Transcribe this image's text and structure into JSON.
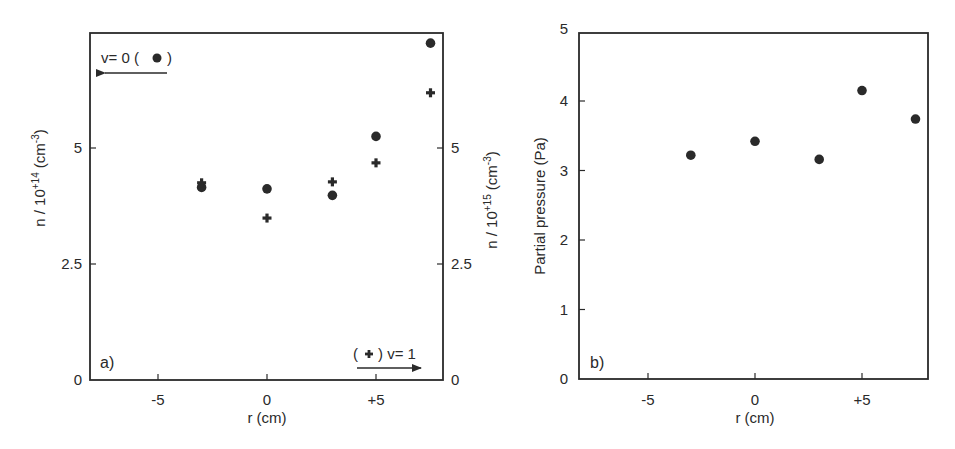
{
  "figure": {
    "panels": [
      {
        "id": "a",
        "panel_label": "a)",
        "xlabel": "r (cm)",
        "ylabel_left": {
          "prefix": "n / 10",
          "exp": "+14",
          "unit_pre": " (cm",
          "unit_exp": "-3",
          "unit_post": ")"
        },
        "ylabel_right": {
          "prefix": "n / 10",
          "exp": "+15",
          "unit_pre": " (cm",
          "unit_exp": "-3",
          "unit_post": ")"
        },
        "xticks": [
          "-5",
          "0",
          "+5"
        ],
        "yticks_left": [
          "0",
          "2.5",
          "5"
        ],
        "yticks_right": [
          "0",
          "2.5",
          "5"
        ],
        "legend": {
          "v0": {
            "label_pre": "v= 0 (",
            "marker": "●",
            "label_post": ")",
            "arrow": "left"
          },
          "v1": {
            "label_pre": "(",
            "marker": "✚",
            "label_post": ") v= 1",
            "arrow": "right"
          }
        }
      },
      {
        "id": "b",
        "panel_label": "b)",
        "xlabel": "r (cm)",
        "ylabel": "Partial pressure (Pa)",
        "xticks": [
          "-5",
          "0",
          "+5"
        ],
        "yticks": [
          "0",
          "1",
          "2",
          "3",
          "4",
          "5"
        ]
      }
    ]
  },
  "chart_data": [
    {
      "type": "scatter",
      "title": "a)",
      "xlabel": "r (cm)",
      "ylabel": "n / 10^+14 (cm^-3)",
      "ylabel_right": "n / 10^+15 (cm^-3)",
      "xlim": [
        -8.2,
        8.1
      ],
      "ylim": [
        0,
        7.48
      ],
      "xticks": [
        -5,
        0,
        5
      ],
      "yticks": [
        0,
        2.5,
        5
      ],
      "grid": false,
      "legend_position": "inline annotations (top-left v=0 → left axis; bottom-right v=1 → right axis)",
      "series": [
        {
          "name": "v= 0 (●) — left axis, n/10^14 cm^-3",
          "marker": "circle",
          "axis": "left",
          "x": [
            -3,
            0,
            3,
            5,
            7.5
          ],
          "y": [
            4.15,
            4.12,
            3.98,
            5.25,
            7.26
          ]
        },
        {
          "name": "v= 1 (✚) — right axis, n/10^15 cm^-3",
          "marker": "plus",
          "axis": "right",
          "x": [
            -3,
            0,
            3,
            5,
            7.5
          ],
          "y": [
            4.25,
            3.49,
            4.27,
            4.68,
            6.19
          ]
        }
      ]
    },
    {
      "type": "scatter",
      "title": "b)",
      "xlabel": "r (cm)",
      "ylabel": "Partial pressure (Pa)",
      "xlim": [
        -8.2,
        8.1
      ],
      "ylim": [
        0,
        5
      ],
      "xticks": [
        -5,
        0,
        5
      ],
      "yticks": [
        0,
        1,
        2,
        3,
        4,
        5
      ],
      "grid": false,
      "series": [
        {
          "name": "Partial pressure",
          "marker": "circle",
          "x": [
            -3,
            0,
            3,
            5,
            7.5
          ],
          "y": [
            3.22,
            3.42,
            3.16,
            4.15,
            3.74
          ]
        }
      ]
    }
  ],
  "colors": {
    "ink": "#2a2a2a",
    "background": "#ffffff"
  }
}
